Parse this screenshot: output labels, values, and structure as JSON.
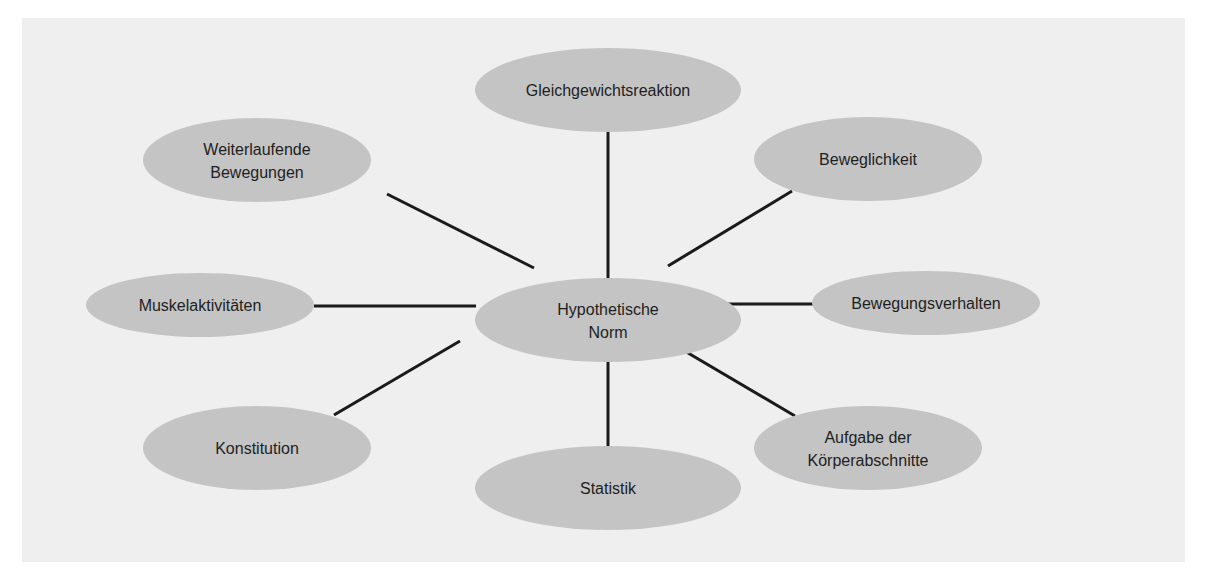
{
  "diagram": {
    "type": "mind-map",
    "colors": {
      "background": "#efefef",
      "node_fill": "#c4c4c4",
      "edge": "#1a1a1a",
      "text": "#1e1e1e"
    },
    "center": {
      "id": "hypothetische-norm",
      "lines": [
        "Hypothetische",
        "Norm"
      ],
      "cx": 608,
      "cy": 320,
      "rx": 133,
      "ry": 42
    },
    "nodes": [
      {
        "id": "gleichgewichtsreaktion",
        "lines": [
          "Gleichgewichtsreaktion"
        ],
        "cx": 608,
        "cy": 90,
        "rx": 133,
        "ry": 42,
        "edge": [
          608,
          132,
          608,
          278
        ]
      },
      {
        "id": "weiterlaufende-bewegungen",
        "lines": [
          "Weiterlaufende",
          "Bewegungen"
        ],
        "cx": 257,
        "cy": 160,
        "rx": 114,
        "ry": 42,
        "edge": [
          387,
          194,
          534,
          268
        ]
      },
      {
        "id": "beweglichkeit",
        "lines": [
          "Beweglichkeit"
        ],
        "cx": 868,
        "cy": 159,
        "rx": 114,
        "ry": 42,
        "edge": [
          792,
          191,
          668,
          266
        ]
      },
      {
        "id": "muskelaktivitaeten",
        "lines": [
          "Muskelaktivitäten"
        ],
        "cx": 200,
        "cy": 305,
        "rx": 114,
        "ry": 32,
        "edge": [
          314,
          306,
          476,
          306
        ]
      },
      {
        "id": "bewegungsverhalten",
        "lines": [
          "Bewegungsverhalten"
        ],
        "cx": 926,
        "cy": 303,
        "rx": 114,
        "ry": 32,
        "edge": [
          722,
          304,
          814,
          304
        ]
      },
      {
        "id": "konstitution",
        "lines": [
          "Konstitution"
        ],
        "cx": 257,
        "cy": 448,
        "rx": 114,
        "ry": 42,
        "edge": [
          334,
          415,
          460,
          341
        ]
      },
      {
        "id": "statistik",
        "lines": [
          "Statistik"
        ],
        "cx": 608,
        "cy": 488,
        "rx": 133,
        "ry": 42,
        "edge": [
          608,
          346,
          608,
          446
        ]
      },
      {
        "id": "aufgabe-der-koerperabschnitte",
        "lines": [
          "Aufgabe der",
          "Körperabschnitte"
        ],
        "cx": 868,
        "cy": 448,
        "rx": 114,
        "ry": 42,
        "edge": [
          666,
          340,
          795,
          416
        ]
      }
    ]
  }
}
